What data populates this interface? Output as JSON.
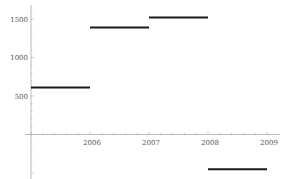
{
  "chart_data": {
    "type": "line",
    "title": "",
    "xlabel": "",
    "ylabel": "",
    "step": true,
    "series": [
      {
        "name": "step",
        "segments": [
          {
            "x_start": 2005,
            "x_end": 2006,
            "y": 610
          },
          {
            "x_start": 2006,
            "x_end": 2007,
            "y": 1390
          },
          {
            "x_start": 2007,
            "x_end": 2008,
            "y": 1520
          },
          {
            "x_start": 2008,
            "x_end": 2009,
            "y": -450
          }
        ]
      }
    ],
    "x_ticks": [
      "2006",
      "2007",
      "2008",
      "2009"
    ],
    "y_ticks": [
      "500",
      "1000",
      "1500"
    ],
    "xlim": [
      2005,
      2009
    ],
    "ylim": [
      -500,
      1600
    ],
    "grid": false,
    "legend": "none",
    "colors": {
      "line": "#1a1a1a",
      "axis": "#aaaaaa",
      "text": "#555555"
    }
  }
}
